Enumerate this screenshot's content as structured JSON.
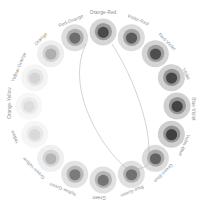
{
  "figure": {
    "name": "color-wheel",
    "background": "#ffffff",
    "center": {
      "x": 103,
      "y": 106
    },
    "label_radius": 93,
    "swatch_radius": 74
  },
  "chart_data": {
    "type": "pie",
    "title": "",
    "subtitle": "",
    "xlabel": "",
    "ylabel": "",
    "grid": false,
    "legend_position": "around-ring",
    "layout": "radial-ring",
    "segment_count": 16,
    "angle_step_degrees": 22.5,
    "categories": [
      "Orange-Red",
      "Violet-Red",
      "Red-Violet",
      "Violet",
      "Blue-Violet",
      "Violet-Blue",
      "Green-Blue",
      "Blue-Green",
      "Green",
      "Yellow-Green",
      "Green-Yellow",
      "Yellow",
      "Orange-Yellow",
      "Yellow-Orange",
      "Orange",
      "Red-Orange"
    ],
    "values": [
      88,
      80,
      86,
      90,
      92,
      94,
      74,
      66,
      64,
      60,
      30,
      14,
      12,
      16,
      34,
      70
    ],
    "ylim": [
      0,
      100
    ],
    "series": [
      {
        "name": "outer-ring-tone",
        "values": [
          "#d6d6d6",
          "#dcdcdc",
          "#d4d4d4",
          "#d2d2d2",
          "#d0d0d0",
          "#cfcfcf",
          "#dcdcdc",
          "#e0e0e0",
          "#e1e1e1",
          "#e3e3e3",
          "#efefef",
          "#f6f6f6",
          "#f7f7f7",
          "#f5f5f5",
          "#eeeeee",
          "#dedede"
        ]
      },
      {
        "name": "middle-ring-tone",
        "values": [
          "#9a9a9a",
          "#a6a6a6",
          "#9d9d9d",
          "#989898",
          "#959595",
          "#939393",
          "#a9a9a9",
          "#b2b2b2",
          "#b4b4b4",
          "#b8b8b8",
          "#d6d6d6",
          "#e9e9e9",
          "#ebebeb",
          "#e6e6e6",
          "#d2d2d2",
          "#aeaeae"
        ]
      },
      {
        "name": "inner-core-tone",
        "values": [
          "#4a4a4a",
          "#5a5a5a",
          "#4e4e4e",
          "#474747",
          "#434343",
          "#404040",
          "#636363",
          "#717171",
          "#747474",
          "#7b7b7b",
          "#b4b4b4",
          "#dadada",
          "#dddddd",
          "#d4d4d4",
          "#aeaeae",
          "#6e6e6e"
        ]
      }
    ],
    "annotations": [
      {
        "name": "complement-arc-left",
        "kind": "curve",
        "color": "#b0b0b0"
      },
      {
        "name": "complement-arc-right",
        "kind": "curve",
        "color": "#b0b0b0"
      }
    ]
  },
  "labels": [
    {
      "text": "Orange-Red",
      "x": 103,
      "y": 13,
      "rotate": 0
    },
    {
      "text": "Violet-Red",
      "x": 138,
      "y": 20,
      "rotate": 22.5
    },
    {
      "text": "Red-Violet",
      "x": 167,
      "y": 42,
      "rotate": 45
    },
    {
      "text": "Violet",
      "x": 186,
      "y": 74,
      "rotate": 67.5
    },
    {
      "text": "Blue-Violet",
      "x": 193,
      "y": 109,
      "rotate": 90
    },
    {
      "text": "Violet-Blue",
      "x": 184,
      "y": 145,
      "rotate": 112.5
    },
    {
      "text": "Green-Blue",
      "x": 163,
      "y": 173,
      "rotate": 135
    },
    {
      "text": "Blue-Green",
      "x": 132,
      "y": 191,
      "rotate": 157.5
    },
    {
      "text": "Green",
      "x": 99,
      "y": 197,
      "rotate": 180
    },
    {
      "text": "Yellow-Green",
      "x": 63,
      "y": 189,
      "rotate": 202.5
    },
    {
      "text": "Green-Yellow",
      "x": 34,
      "y": 168,
      "rotate": 225
    },
    {
      "text": "Yellow",
      "x": 15,
      "y": 137,
      "rotate": 247.5
    },
    {
      "text": "Orange-Yellow",
      "x": 10,
      "y": 103,
      "rotate": 270
    },
    {
      "text": "Yellow-Orange",
      "x": 19,
      "y": 67,
      "rotate": 292.5
    },
    {
      "text": "Orange",
      "x": 41,
      "y": 39,
      "rotate": 315
    },
    {
      "text": "Red-Orange",
      "x": 71,
      "y": 21,
      "rotate": 337.5
    }
  ]
}
